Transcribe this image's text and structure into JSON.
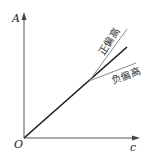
{
  "diagram": {
    "title": "",
    "y_axis_label": "A",
    "x_axis_label": "c",
    "origin_label": "O",
    "curves": [
      {
        "name": "ideal-line",
        "label": "",
        "color": "#1a1a1a"
      },
      {
        "name": "positive-deviation",
        "label": "正偏高",
        "color": "#8a8a8a"
      },
      {
        "name": "negative-deviation",
        "label": "负偏高",
        "color": "#8a8a8a"
      }
    ]
  }
}
